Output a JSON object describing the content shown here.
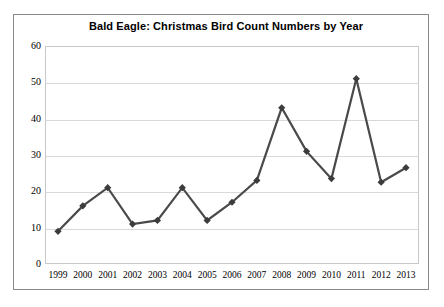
{
  "chart_data": {
    "type": "line",
    "title": "Bald Eagle: Christmas Bird Count Numbers by Year",
    "xlabel": "",
    "ylabel": "",
    "categories": [
      "1999",
      "2000",
      "2001",
      "2002",
      "2003",
      "2004",
      "2005",
      "2006",
      "2007",
      "2008",
      "2009",
      "2010",
      "2011",
      "2012",
      "2013"
    ],
    "values": [
      9,
      16,
      21,
      11,
      12,
      21,
      12,
      17,
      23,
      43,
      31,
      23.5,
      51,
      22.5,
      26.5
    ],
    "series": [
      {
        "name": "Bald Eagle Count",
        "values": [
          9,
          16,
          21,
          11,
          12,
          21,
          12,
          17,
          23,
          43,
          31,
          23.5,
          51,
          22.5,
          26.5
        ]
      }
    ],
    "ylim": [
      0,
      60
    ],
    "ytick_values": [
      0,
      10,
      20,
      30,
      40,
      50,
      60
    ],
    "ytick_labels": [
      "0",
      "10",
      "20",
      "30",
      "40",
      "50",
      "60"
    ],
    "grid": true,
    "grid_axis": "y",
    "legend": false,
    "legend_position": "none",
    "marker": "diamond",
    "line_color": "#4a4a4a",
    "marker_color": "#3c3c3c",
    "grid_color": "#d9d9d9",
    "plot_border_color": "#c9c9c9",
    "card_border_color": "#8a8a8a",
    "background_color": "#ffffff"
  }
}
